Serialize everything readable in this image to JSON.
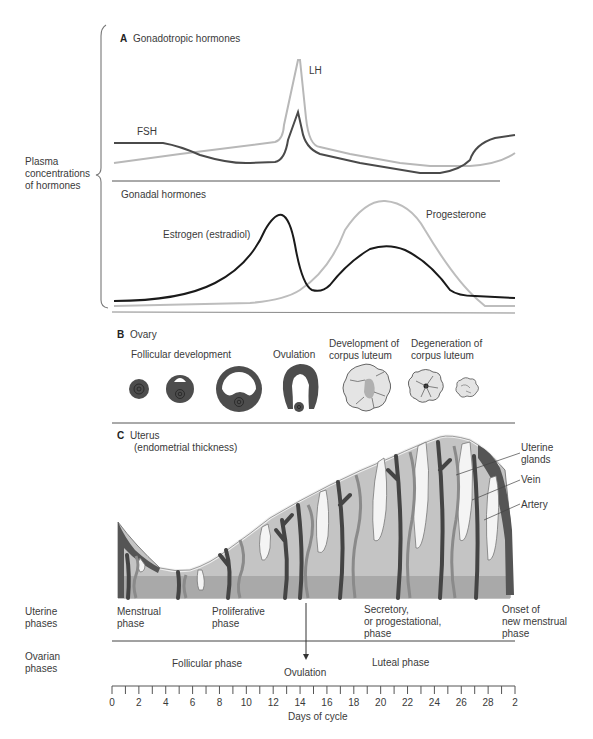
{
  "panelA": {
    "letter": "A",
    "title": "Gonadotropic hormones",
    "lh_label": "LH",
    "fsh_label": "FSH"
  },
  "yaxis": {
    "line1": "Plasma",
    "line2": "concentrations",
    "line3": "of hormones"
  },
  "gonadal": {
    "title": "Gonadal hormones",
    "estrogen_label": "Estrogen (estradiol)",
    "progesterone_label": "Progesterone"
  },
  "panelB": {
    "letter": "B",
    "title": "Ovary",
    "stages": [
      {
        "label": "Follicular development"
      },
      {
        "label": "Ovulation"
      },
      {
        "label1": "Development of",
        "label2": "corpus luteum"
      },
      {
        "label1": "Degeneration of",
        "label2": "corpus luteum"
      }
    ]
  },
  "panelC": {
    "letter": "C",
    "title": "Uterus",
    "subtitle": "(endometrial thickness)",
    "callouts": [
      {
        "line1": "Uterine",
        "line2": "glands"
      },
      {
        "line1": "Vein"
      },
      {
        "line1": "Artery"
      }
    ]
  },
  "uterine_phases": {
    "row_label1": "Uterine",
    "row_label2": "phases",
    "phases": [
      {
        "line1": "Menstrual",
        "line2": "phase"
      },
      {
        "line1": "Proliferative",
        "line2": "phase"
      },
      {
        "line1": "Secretory,",
        "line2": "or progestational,",
        "line3": "phase"
      },
      {
        "line1": "Onset of",
        "line2": "new menstrual",
        "line3": "phase"
      }
    ]
  },
  "ovarian_phases": {
    "row_label1": "Ovarian",
    "row_label2": "phases",
    "follicular": "Follicular phase",
    "ovulation": "Ovulation",
    "luteal": "Luteal phase"
  },
  "xaxis": {
    "label": "Days of cycle",
    "ticks": [
      "0",
      "2",
      "4",
      "6",
      "8",
      "10",
      "12",
      "14",
      "16",
      "18",
      "20",
      "22",
      "24",
      "26",
      "28",
      "2"
    ]
  },
  "colors": {
    "dark_line": "#4a4a4a",
    "light_line": "#b8b8b8",
    "estrogen": "#1a1a1a",
    "progesterone": "#bdbdbd",
    "tissue_fill": "#c4c4c4",
    "basal_fill": "#a9a9a9",
    "vessel_dark": "#444444",
    "follicle_dark": "#4d4d4d"
  },
  "chart_data": {
    "type": "line",
    "xlabel": "Days of cycle",
    "ylabel": "Plasma concentrations of hormones",
    "x": [
      0,
      2,
      4,
      6,
      8,
      10,
      12,
      13,
      14,
      15,
      16,
      18,
      20,
      22,
      24,
      26,
      27,
      28,
      30
    ],
    "panels": [
      {
        "name": "Gonadotropic hormones",
        "series": [
          {
            "name": "LH",
            "values": [
              20,
              23,
              26,
              29,
              32,
              35,
              38,
              45,
              100,
              40,
              30,
              25,
              21,
              19,
              18,
              18,
              22,
              25,
              26
            ]
          },
          {
            "name": "FSH",
            "values": [
              36,
              36,
              36,
              30,
              22,
              19,
              19,
              25,
              60,
              24,
              20,
              16,
              13,
              11,
              10,
              13,
              30,
              38,
              40
            ]
          }
        ]
      },
      {
        "name": "Gonadal hormones",
        "series": [
          {
            "name": "Estrogen (estradiol)",
            "values": [
              5,
              5,
              7,
              12,
              20,
              40,
              90,
              80,
              20,
              12,
              28,
              50,
              55,
              50,
              32,
              13,
              12,
              11,
              10
            ]
          },
          {
            "name": "Progesterone",
            "values": [
              2,
              2,
              2,
              2,
              2,
              3,
              3,
              5,
              10,
              30,
              70,
              95,
              100,
              90,
              60,
              15,
              5,
              4,
              4
            ]
          }
        ]
      }
    ]
  }
}
